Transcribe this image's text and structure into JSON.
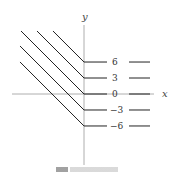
{
  "figure": {
    "axes": {
      "x_label": "x",
      "y_label": "y"
    },
    "level_curves": {
      "description": "Level curves of f(x,y) = y + max(x,0)... piecewise: diagonal slope -1 for x<0, horizontal for x>0",
      "levels": [
        6,
        3,
        0,
        -3,
        -6
      ],
      "labels": [
        "6",
        "3",
        "0",
        "−3",
        "−6"
      ]
    },
    "colors": {
      "curve": "#222222",
      "axis": "#888888",
      "label": "#333333"
    }
  }
}
